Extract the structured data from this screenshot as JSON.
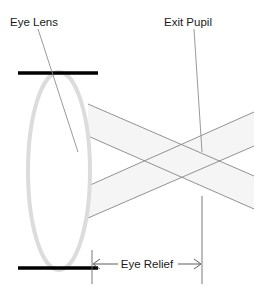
{
  "diagram": {
    "canvas": {
      "width": 254,
      "height": 296,
      "background": "#ffffff"
    },
    "labels": {
      "eye_lens": "Eye Lens",
      "exit_pupil": "Exit Pupil",
      "eye_relief": "Eye Relief"
    },
    "colors": {
      "background": "#ffffff",
      "text": "#1a1a1a",
      "aperture_bar": "#000000",
      "lens_outline": "#d8d8d8",
      "ray_line": "#808080",
      "ray_fill": "#f4f4f4",
      "leader_line": "#8c8c8c",
      "dimension_line": "#5a5a5a"
    },
    "elements": {
      "lens": {
        "name": "eye-lens",
        "shape": "ellipse",
        "cx": 59,
        "cy": 171,
        "rx": 31,
        "ry": 99,
        "stroke_width": 4
      },
      "aperture_bars": [
        {
          "name": "top-aperture-bar",
          "x1": 18,
          "y1": 73,
          "x2": 98,
          "y2": 73
        },
        {
          "name": "bottom-aperture-bar",
          "x1": 18,
          "y1": 268,
          "x2": 98,
          "y2": 268
        }
      ],
      "exit_pupil_point": {
        "x": 202,
        "y": 152
      },
      "lower_crossing_point": {
        "x": 202,
        "y": 192
      },
      "ray_bundles": [
        {
          "name": "upper-bundle",
          "direction": "down-right",
          "start_top": {
            "x": 88,
            "y": 104
          },
          "start_bottom": {
            "x": 88,
            "y": 136
          },
          "end_top": {
            "x": 254,
            "y": 176
          },
          "end_bottom": {
            "x": 254,
            "y": 209
          }
        },
        {
          "name": "lower-bundle",
          "direction": "up-right",
          "start_top": {
            "x": 88,
            "y": 186
          },
          "start_bottom": {
            "x": 88,
            "y": 218
          },
          "end_top": {
            "x": 254,
            "y": 112
          },
          "end_bottom": {
            "x": 254,
            "y": 146
          }
        }
      ],
      "leaders": [
        {
          "name": "eye-lens-leader",
          "x1": 38,
          "y1": 29,
          "x2": 78,
          "y2": 152
        },
        {
          "name": "exit-pupil-leader",
          "x1": 194,
          "y1": 29,
          "x2": 202,
          "y2": 152
        }
      ],
      "dimension": {
        "name": "eye-relief-dimension",
        "y": 264,
        "x_start": 92,
        "x_end": 202,
        "extension_top_y": 196,
        "extension_bottom_y": 284,
        "label_x": 147,
        "label_y": 268
      }
    }
  }
}
